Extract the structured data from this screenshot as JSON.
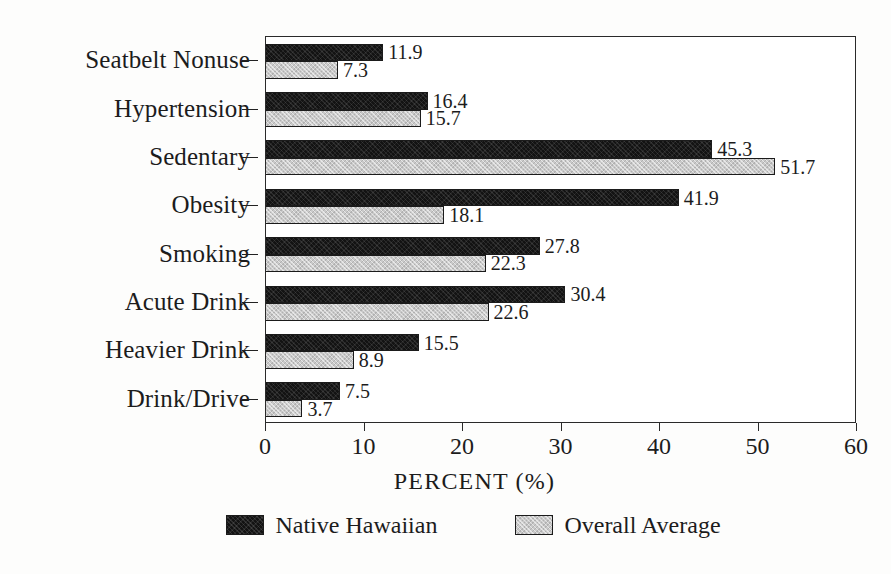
{
  "chart_data": {
    "type": "bar",
    "orientation": "horizontal",
    "title": "",
    "xlabel": "PERCENT (%)",
    "ylabel": "",
    "xlim": [
      0,
      60
    ],
    "xticks": [
      0,
      10,
      20,
      30,
      40,
      50,
      60
    ],
    "xtick_labels": [
      "0",
      "10",
      "20",
      "30",
      "40",
      "50",
      "60"
    ],
    "grid": true,
    "grid_axis": "x",
    "legend_position": "bottom",
    "categories": [
      "Seatbelt Nonuse",
      "Hypertension",
      "Sedentary",
      "Obesity",
      "Smoking",
      "Acute Drink",
      "Heavier Drink",
      "Drink/Drive"
    ],
    "series": [
      {
        "name": "Native Hawaiian",
        "color": "#131313",
        "values": [
          11.9,
          16.4,
          45.3,
          41.9,
          27.8,
          30.4,
          15.5,
          7.5
        ],
        "labels": [
          "11.9",
          "16.4",
          "45.3",
          "41.9",
          "27.8",
          "30.4",
          "15.5",
          "7.5"
        ]
      },
      {
        "name": "Overall Average",
        "color": "#c9c9c9",
        "values": [
          7.3,
          15.7,
          51.7,
          18.1,
          22.3,
          22.6,
          8.9,
          3.7
        ],
        "labels": [
          "7.3",
          "15.7",
          "51.7",
          "18.1",
          "22.3",
          "22.6",
          "8.9",
          "3.7"
        ]
      }
    ]
  },
  "legend": {
    "items": [
      {
        "label": "Native Hawaiian",
        "swatch": "black-filled-swatch"
      },
      {
        "label": "Overall Average",
        "swatch": "gray-filled-swatch"
      }
    ]
  },
  "axis": {
    "x_title": "PERCENT (%)"
  },
  "colors": {
    "series_native_hawaiian": "#131313",
    "series_overall_average": "#c9c9c9",
    "axis": "#2a2a2a",
    "text": "#1c1c1c",
    "background": "#fdfdfc"
  }
}
